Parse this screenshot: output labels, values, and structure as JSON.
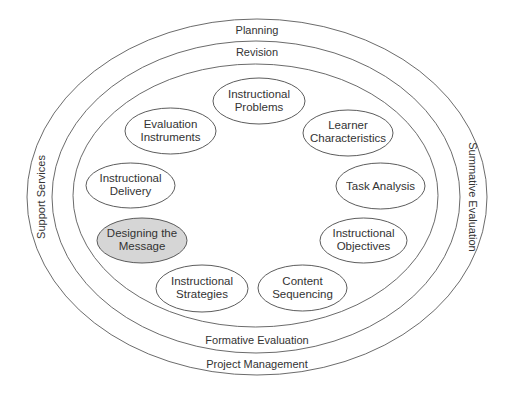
{
  "diagram": {
    "rings": {
      "outer": {
        "top_label": "Planning",
        "bottom_label": "Project Management",
        "left_label": "Support Services",
        "right_label": "Summative Evaluation"
      },
      "middle": {
        "top_label": "Revision",
        "bottom_label": "Formative Evaluation"
      }
    },
    "nodes": [
      {
        "id": "instructional-problems",
        "line1": "Instructional",
        "line2": "Problems",
        "highlighted": false
      },
      {
        "id": "learner-characteristics",
        "line1": "Learner",
        "line2": "Characteristics",
        "highlighted": false
      },
      {
        "id": "task-analysis",
        "line1": "Task Analysis",
        "line2": "",
        "highlighted": false
      },
      {
        "id": "instructional-objectives",
        "line1": "Instructional",
        "line2": "Objectives",
        "highlighted": false
      },
      {
        "id": "content-sequencing",
        "line1": "Content",
        "line2": "Sequencing",
        "highlighted": false
      },
      {
        "id": "instructional-strategies",
        "line1": "Instructional",
        "line2": "Strategies",
        "highlighted": false
      },
      {
        "id": "designing-the-message",
        "line1": "Designing the",
        "line2": "Message",
        "highlighted": true
      },
      {
        "id": "instructional-delivery",
        "line1": "Instructional",
        "line2": "Delivery",
        "highlighted": false
      },
      {
        "id": "evaluation-instruments",
        "line1": "Evaluation",
        "line2": "Instruments",
        "highlighted": false
      }
    ],
    "colors": {
      "highlight_fill": "#d6d6d6",
      "stroke": "#4a4a4a",
      "text": "#333333"
    }
  }
}
